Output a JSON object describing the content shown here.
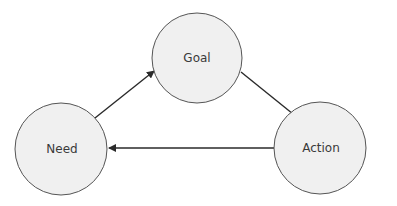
{
  "diagram": {
    "type": "cycle",
    "nodes": [
      {
        "id": "goal",
        "label": "Goal",
        "cx": 197,
        "cy": 58,
        "r": 45
      },
      {
        "id": "action",
        "label": "Action",
        "cx": 320,
        "cy": 148,
        "r": 46
      },
      {
        "id": "need",
        "label": "Need",
        "cx": 61,
        "cy": 149,
        "r": 46
      }
    ],
    "edges": [
      {
        "from": "need",
        "to": "goal"
      },
      {
        "from": "goal",
        "to": "action"
      },
      {
        "from": "action",
        "to": "need"
      }
    ],
    "colors": {
      "node_fill": "#f0f0f0",
      "node_stroke": "#555555",
      "edge": "#2a2a2a",
      "label": "#3a3a3a"
    }
  }
}
